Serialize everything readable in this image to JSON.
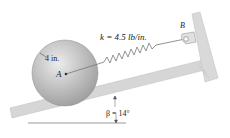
{
  "diagram": {
    "spring_label": "k = 4.5 lb/in.",
    "radius_label": "4 in.",
    "center_label": "A",
    "anchor_label": "B",
    "angle_label": "β = 14°",
    "colors": {
      "surface": "#d6d6d6",
      "surface_edge": "#b8b8b8",
      "disk_light": "#e8e8e8",
      "disk_dark": "#9a9a9a",
      "line": "#555555"
    }
  }
}
